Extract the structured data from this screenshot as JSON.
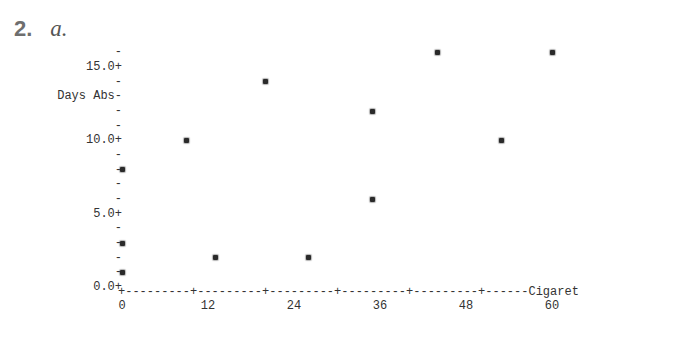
{
  "header": {
    "problem_number": "2.",
    "problem_part": "a."
  },
  "chart_data": {
    "type": "scatter",
    "title": "",
    "xlabel": "Cigaret",
    "ylabel": "Days Abs",
    "xlim": [
      0,
      66
    ],
    "ylim": [
      0,
      16
    ],
    "x_ticks": [
      0,
      12,
      24,
      36,
      48,
      60
    ],
    "x_tick_labels": [
      "0",
      "12",
      "24",
      "36",
      "48",
      "60"
    ],
    "y_ticks": [
      0,
      5,
      10,
      15
    ],
    "y_tick_labels": [
      "0.0",
      "5.0",
      "10.0",
      "15.0"
    ],
    "grid": false,
    "marker": "*",
    "x": [
      0,
      0,
      0,
      9,
      13,
      20,
      26,
      35,
      35,
      44,
      53,
      60
    ],
    "y": [
      8,
      3,
      1,
      10,
      2,
      14,
      2,
      12,
      6,
      16,
      10,
      16
    ],
    "points": [
      {
        "x": 0,
        "y": 8
      },
      {
        "x": 0,
        "y": 3
      },
      {
        "x": 0,
        "y": 1
      },
      {
        "x": 9,
        "y": 10
      },
      {
        "x": 13,
        "y": 2
      },
      {
        "x": 20,
        "y": 14
      },
      {
        "x": 26,
        "y": 2
      },
      {
        "x": 35,
        "y": 12
      },
      {
        "x": 35,
        "y": 6
      },
      {
        "x": 44,
        "y": 16
      },
      {
        "x": 53,
        "y": 10
      },
      {
        "x": 60,
        "y": 16
      }
    ]
  },
  "axis_text": {
    "y_rows": [
      {
        "value": 16,
        "text": "-"
      },
      {
        "value": 15,
        "text": "15.0+"
      },
      {
        "value": 14,
        "text": "-"
      },
      {
        "value": 13,
        "text": "Days Abs-"
      },
      {
        "value": 12,
        "text": "-"
      },
      {
        "value": 11,
        "text": "-"
      },
      {
        "value": 10,
        "text": "10.0+"
      },
      {
        "value": 9,
        "text": "-"
      },
      {
        "value": 8,
        "text": "-"
      },
      {
        "value": 7,
        "text": "-"
      },
      {
        "value": 6,
        "text": "-"
      },
      {
        "value": 5,
        "text": "5.0+"
      },
      {
        "value": 4,
        "text": "-"
      },
      {
        "value": 3,
        "text": "-"
      },
      {
        "value": 2,
        "text": "-"
      },
      {
        "value": 1,
        "text": "-"
      },
      {
        "value": 0,
        "text": "0.0+"
      }
    ],
    "x_axis_line": "+---------+---------+---------+---------+---------+------Cigaret"
  }
}
